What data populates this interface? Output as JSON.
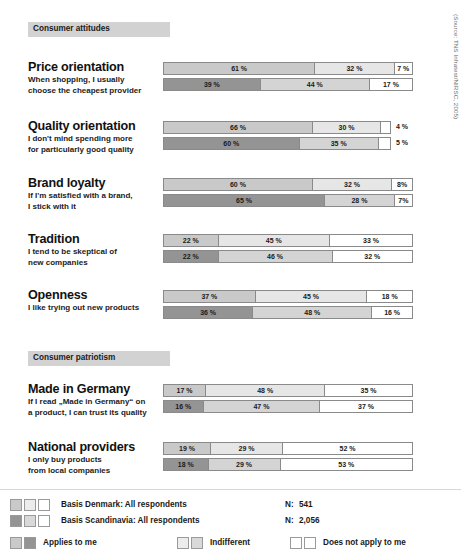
{
  "source_credit": "(Source: TNS Infratest/NIRSC, 2005)",
  "sections": [
    {
      "id": "consumer-attitudes",
      "label": "Consumer attitudes"
    },
    {
      "id": "consumer-patriotism",
      "label": "Consumer patriotism"
    }
  ],
  "legend": {
    "basis_rows": [
      {
        "label": "Basis Denmark: All respondents",
        "n_label": "N:",
        "n_value": "541"
      },
      {
        "label": "Basis Scandinavia: All respondents",
        "n_label": "N:",
        "n_value": "2,056"
      }
    ],
    "keys": [
      {
        "label": "Applies to me"
      },
      {
        "label": "Indifferent"
      },
      {
        "label": "Does not apply to me"
      }
    ]
  },
  "chart_data": {
    "type": "bar",
    "subtitle": "",
    "orientation": "horizontal",
    "stacked": true,
    "xlabel": "",
    "ylabel": "",
    "xlim": [
      0,
      100
    ],
    "grid": false,
    "legend_position": "bottom",
    "categories": [
      "Applies to me",
      "Indifferent",
      "Does not apply to me"
    ],
    "series": [
      {
        "name": "Basis Denmark: All respondents",
        "n": 541
      },
      {
        "name": "Basis Scandinavia: All respondents",
        "n": 2056
      }
    ],
    "items": [
      {
        "section": "Consumer attitudes",
        "title": "Price orientation",
        "subtitle_lines": [
          "When shopping, I usually",
          "choose the cheapest provider"
        ],
        "rows": [
          {
            "series": "Basis Denmark: All respondents",
            "values": [
              61,
              32,
              7
            ],
            "labels": [
              "61 %",
              "32 %",
              "7 %"
            ],
            "outside": []
          },
          {
            "series": "Basis Scandinavia: All respondents",
            "values": [
              39,
              44,
              17
            ],
            "labels": [
              "39 %",
              "44 %",
              "17 %"
            ],
            "outside": []
          }
        ]
      },
      {
        "section": "Consumer attitudes",
        "title": "Quality orientation",
        "subtitle_lines": [
          "I don't mind spending more",
          "for particularly good quality"
        ],
        "rows": [
          {
            "series": "Basis Denmark: All respondents",
            "values": [
              66,
              30,
              4
            ],
            "labels": [
              "66 %",
              "30 %",
              ""
            ],
            "outside": [
              "4 %"
            ]
          },
          {
            "series": "Basis Scandinavia: All respondents",
            "values": [
              60,
              35,
              5
            ],
            "labels": [
              "60 %",
              "35 %",
              ""
            ],
            "outside": [
              "5 %"
            ]
          }
        ]
      },
      {
        "section": "Consumer attitudes",
        "title": "Brand loyalty",
        "subtitle_lines": [
          "If I'm satisfied with a brand,",
          "I stick with it"
        ],
        "rows": [
          {
            "series": "Basis Denmark: All respondents",
            "values": [
              60,
              32,
              8
            ],
            "labels": [
              "60 %",
              "32 %",
              "8%"
            ],
            "outside": []
          },
          {
            "series": "Basis Scandinavia: All respondents",
            "values": [
              65,
              28,
              7
            ],
            "labels": [
              "65 %",
              "28 %",
              "7%"
            ],
            "outside": []
          }
        ]
      },
      {
        "section": "Consumer attitudes",
        "title": "Tradition",
        "subtitle_lines": [
          "I tend to be skeptical of",
          "new companies"
        ],
        "rows": [
          {
            "series": "Basis Denmark: All respondents",
            "values": [
              22,
              45,
              33
            ],
            "labels": [
              "22 %",
              "45 %",
              "33 %"
            ],
            "outside": []
          },
          {
            "series": "Basis Scandinavia: All respondents",
            "values": [
              22,
              46,
              32
            ],
            "labels": [
              "22 %",
              "46 %",
              "32 %"
            ],
            "outside": []
          }
        ]
      },
      {
        "section": "Consumer attitudes",
        "title": "Openness",
        "subtitle_lines": [
          "I like trying out new products"
        ],
        "rows": [
          {
            "series": "Basis Denmark: All respondents",
            "values": [
              37,
              45,
              18
            ],
            "labels": [
              "37 %",
              "45 %",
              "18 %"
            ],
            "outside": []
          },
          {
            "series": "Basis Scandinavia: All respondents",
            "values": [
              36,
              48,
              16
            ],
            "labels": [
              "36 %",
              "48 %",
              "16 %"
            ],
            "outside": []
          }
        ]
      },
      {
        "section": "Consumer patriotism",
        "title": "Made in Germany",
        "subtitle_lines": [
          "If I read „Made in Germany“ on",
          "a product, I can trust its quality"
        ],
        "rows": [
          {
            "series": "Basis Denmark: All respondents",
            "values": [
              17,
              48,
              35
            ],
            "labels": [
              "17 %",
              "48 %",
              "35 %"
            ],
            "outside": []
          },
          {
            "series": "Basis Scandinavia: All respondents",
            "values": [
              16,
              47,
              37
            ],
            "labels": [
              "16 %",
              "47 %",
              "37 %"
            ],
            "outside": []
          }
        ]
      },
      {
        "section": "Consumer patriotism",
        "title": "National providers",
        "subtitle_lines": [
          "I only buy products",
          "from local companies"
        ],
        "rows": [
          {
            "series": "Basis Denmark: All respondents",
            "values": [
              19,
              29,
              52
            ],
            "labels": [
              "19 %",
              "29 %",
              "52 %"
            ],
            "outside": []
          },
          {
            "series": "Basis Scandinavia: All respondents",
            "values": [
              18,
              29,
              53
            ],
            "labels": [
              "18 %",
              "29 %",
              "53 %"
            ],
            "outside": []
          }
        ]
      }
    ]
  },
  "colors": {
    "band_bg": "#d2d2d2",
    "applies_denmark": "#c9c9c9",
    "indifferent_denmark": "#e6e6e6",
    "notapply_denmark": "#ffffff",
    "applies_scandinavia": "#949494",
    "indifferent_scandinavia": "#d4d4d4",
    "notapply_scandinavia": "#ffffff",
    "bar_border": "#8a8a8a",
    "text": "#1a1a1a"
  }
}
